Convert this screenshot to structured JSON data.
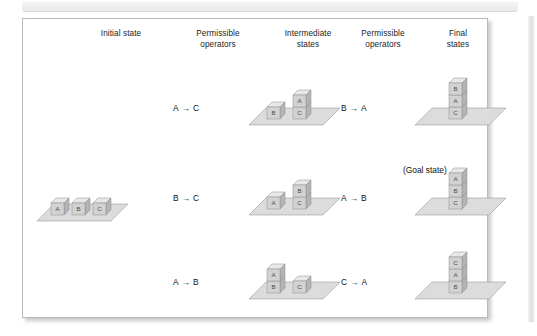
{
  "figure": {
    "columns": [
      {
        "id": "initial-state",
        "line1": "Initial state",
        "line2": ""
      },
      {
        "id": "operators-1",
        "line1": "Permissible",
        "line2": "operators"
      },
      {
        "id": "intermediate",
        "line1": "Intermediate",
        "line2": "states"
      },
      {
        "id": "operators-2",
        "line1": "Permissible",
        "line2": "operators"
      },
      {
        "id": "final-states",
        "line1": "Final",
        "line2": "states"
      }
    ],
    "goal_state_label": "(Goal state)",
    "arrow_glyph": "→",
    "colors": {
      "frame_border": "#b9b9b9",
      "surface_fill": "#dcdcdc",
      "surface_stroke": "#9a9a9a",
      "block_front": "#d2d2d2",
      "block_top": "#e8e8e8",
      "block_side": "#b4b4b4",
      "block_stroke": "#8e8e8e",
      "text": "#1b1b1b"
    },
    "rows": [
      {
        "id": "row-1",
        "operator_1": {
          "from": "A",
          "to": "C",
          "text": "A → C"
        },
        "operator_2": {
          "from": "B",
          "to": "A",
          "text": "B → A"
        },
        "intermediate_state": {
          "description": "B on surface; A stacked on C",
          "piles": [
            [
              "B"
            ],
            [
              "A",
              "C"
            ]
          ]
        },
        "final_state": {
          "description": "Stack B on A on C",
          "piles": [
            [
              "B",
              "A",
              "C"
            ]
          ]
        },
        "is_goal": false
      },
      {
        "id": "row-2",
        "operator_1": {
          "from": "B",
          "to": "C",
          "text": "B → C"
        },
        "operator_2": {
          "from": "A",
          "to": "B",
          "text": "A → B"
        },
        "intermediate_state": {
          "description": "A on surface; B stacked on C",
          "piles": [
            [
              "A"
            ],
            [
              "B",
              "C"
            ]
          ]
        },
        "final_state": {
          "description": "Stack A on B on C",
          "piles": [
            [
              "A",
              "B",
              "C"
            ]
          ]
        },
        "is_goal": true
      },
      {
        "id": "row-3",
        "operator_1": {
          "from": "A",
          "to": "B",
          "text": "A → B"
        },
        "operator_2": {
          "from": "C",
          "to": "A",
          "text": "C → A"
        },
        "intermediate_state": {
          "description": "A stacked on B; C on surface",
          "piles": [
            [
              "A",
              "B"
            ],
            [
              "C"
            ]
          ]
        },
        "final_state": {
          "description": "Stack C on A on B",
          "piles": [
            [
              "C",
              "A",
              "B"
            ]
          ]
        },
        "is_goal": false
      }
    ],
    "initial_state": {
      "description": "Blocks A, B and C side by side on the surface",
      "piles": [
        [
          "A"
        ],
        [
          "B"
        ],
        [
          "C"
        ]
      ]
    }
  }
}
